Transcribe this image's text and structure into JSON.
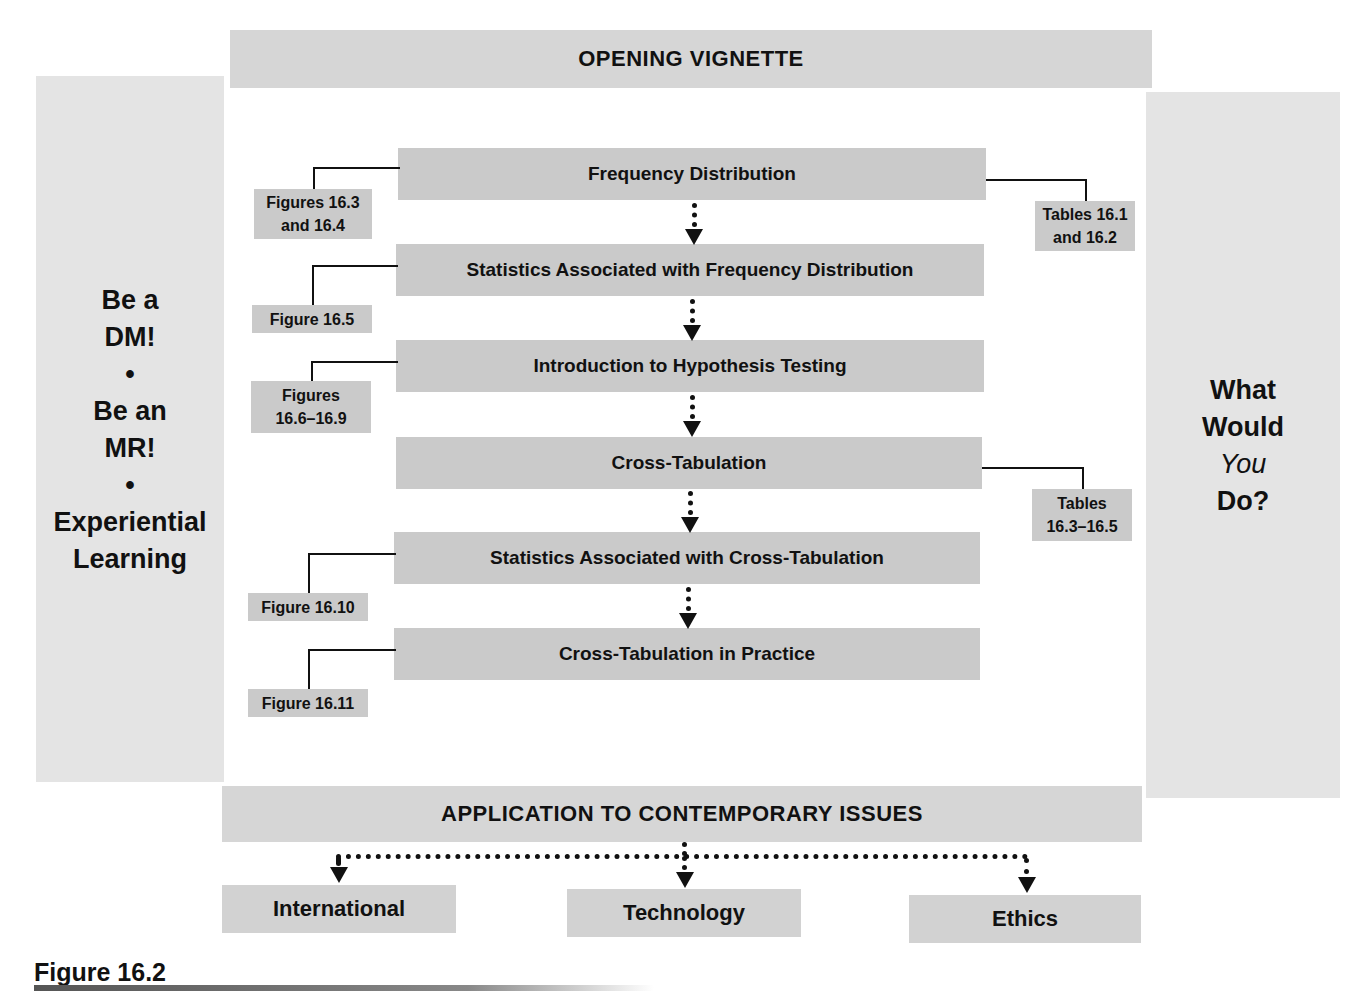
{
  "header": {
    "title": "OPENING VIGNETTE"
  },
  "left_panel": {
    "lines": [
      "Be a",
      "DM!",
      "•",
      "Be an",
      "MR!",
      "•",
      "Experiential",
      "Learning"
    ]
  },
  "right_panel": {
    "lines": [
      "What",
      "Would",
      "You",
      "Do?"
    ],
    "italic_line_index": 2
  },
  "flow": {
    "steps": [
      {
        "label": "Frequency Distribution",
        "ref": "Figures 16.3 and 16.4",
        "ref_lines": [
          "Figures 16.3",
          "and 16.4"
        ],
        "ref_side": "left",
        "ref2_lines": [
          "Tables 16.1",
          "and 16.2"
        ]
      },
      {
        "label": "Statistics Associated with Frequency Distribution",
        "ref_lines": [
          "Figure 16.5"
        ],
        "ref_side": "left"
      },
      {
        "label": "Introduction to Hypothesis Testing",
        "ref_lines": [
          "Figures",
          "16.6–16.9"
        ],
        "ref_side": "left"
      },
      {
        "label": "Cross-Tabulation",
        "ref_lines": [
          "Tables",
          "16.3–16.5"
        ],
        "ref_side": "right"
      },
      {
        "label": "Statistics Associated with Cross-Tabulation",
        "ref_lines": [
          "Figure 16.10"
        ],
        "ref_side": "left"
      },
      {
        "label": "Cross-Tabulation in Practice",
        "ref_lines": [
          "Figure 16.11"
        ],
        "ref_side": "left"
      }
    ]
  },
  "applications": {
    "title": "APPLICATION TO CONTEMPORARY ISSUES",
    "items": [
      "International",
      "Technology",
      "Ethics"
    ]
  },
  "caption": "Figure 16.2",
  "colors": {
    "panel_bg": "#e4e4e4",
    "box_bg": "#cacaca",
    "text": "#111111"
  }
}
